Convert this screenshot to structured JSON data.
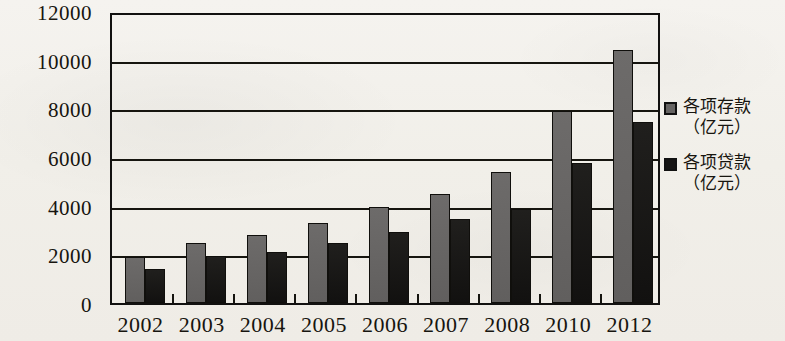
{
  "chart_data": {
    "type": "bar",
    "title": "",
    "subtitle": "",
    "xlabel": "",
    "ylabel": "",
    "categories": [
      "2002",
      "2003",
      "2004",
      "2005",
      "2006",
      "2007",
      "2008",
      "2010",
      "2012"
    ],
    "series": [
      {
        "name": "各项存款（亿元）",
        "name_line1": "各项存款",
        "name_line2": "（亿元）",
        "color": "#666463",
        "values": [
          1900,
          2450,
          2800,
          3300,
          3950,
          4500,
          5400,
          7900,
          10400
        ]
      },
      {
        "name": "各项贷款（亿元）",
        "name_line1": "各项贷款",
        "name_line2": "（亿元）",
        "color": "#151413",
        "values": [
          1400,
          1950,
          2100,
          2450,
          2900,
          3450,
          3850,
          5750,
          7450
        ]
      }
    ],
    "ylim": [
      0,
      12000
    ],
    "yticks": [
      0,
      2000,
      4000,
      6000,
      8000,
      10000,
      12000
    ],
    "ytick_labels": [
      "0",
      "2000",
      "4000",
      "6000",
      "8000",
      "10000",
      "12000"
    ],
    "grid": true,
    "grid_axis": "y",
    "legend_position": "right"
  },
  "legend": {
    "entries": [
      {
        "label_line1": "各项存款",
        "label_line2": "（亿元）",
        "swatch": "deposits"
      },
      {
        "label_line1": "各项贷款",
        "label_line2": "（亿元）",
        "swatch": "loans"
      }
    ]
  },
  "colors": {
    "deposits": "#666463",
    "loans": "#151413",
    "axis": "#16150f",
    "background": "#f3f1ed"
  }
}
